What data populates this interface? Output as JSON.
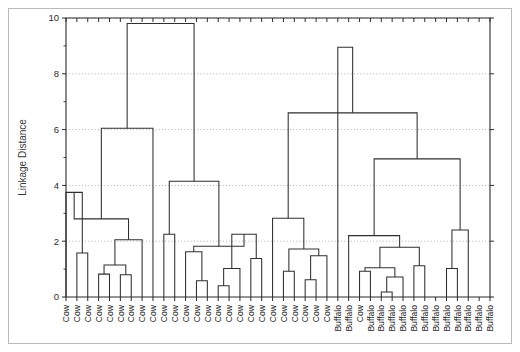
{
  "chart_data": {
    "type": "line",
    "subtype": "dendrogram",
    "title": "",
    "xlabel": "",
    "ylabel": "Linkage Distance",
    "ylim": [
      0,
      10
    ],
    "yticks": [
      0,
      2,
      4,
      6,
      8,
      10
    ],
    "ytick_labels": [
      "0",
      "2",
      "4",
      "6",
      "8",
      "10"
    ],
    "yticks_minor": [
      1,
      3,
      5,
      7,
      9
    ],
    "grid": "horizontal-dotted",
    "legend": "none",
    "orientation": "vertical",
    "leaf_labels": [
      "Cow",
      "Cow",
      "Cow",
      "Cow",
      "Cow",
      "Cow",
      "Cow",
      "Cow",
      "Cow",
      "Cow",
      "Cow",
      "Cow",
      "Cow",
      "Cow",
      "Cow",
      "Cow",
      "Cow",
      "Cow",
      "Cow",
      "Cow",
      "Cow",
      "Cow",
      "Cow",
      "Cow",
      "Cow",
      "Buffalo",
      "Buffalo",
      "Cow",
      "Buffalo",
      "Buffalo",
      "Buffalo",
      "Buffalo",
      "Buffalo",
      "Buffalo",
      "Buffalo",
      "Buffalo",
      "Buffalo",
      "Buffalo",
      "Buffalo",
      "Buffalo"
    ],
    "n_leaves": 40,
    "merges": [
      {
        "id": "m1",
        "left": {
          "leaf": 1
        },
        "right": {
          "leaf": 2
        },
        "height": 1.58
      },
      {
        "id": "m2",
        "left": {
          "node": "m1"
        },
        "right": {
          "leaf": 0
        },
        "height": 3.75
      },
      {
        "id": "m3",
        "left": {
          "leaf": 3
        },
        "right": {
          "leaf": 4
        },
        "height": 0.82
      },
      {
        "id": "m4",
        "left": {
          "leaf": 5
        },
        "right": {
          "leaf": 6
        },
        "height": 0.8
      },
      {
        "id": "m5",
        "left": {
          "node": "m3"
        },
        "right": {
          "node": "m4"
        },
        "height": 1.15
      },
      {
        "id": "m6",
        "left": {
          "node": "m5"
        },
        "right": {
          "leaf": 7
        },
        "height": 2.05
      },
      {
        "id": "m7",
        "left": {
          "node": "m6"
        },
        "right": {
          "node": "m2"
        },
        "height": 2.8
      },
      {
        "id": "m8",
        "left": {
          "node": "m7"
        },
        "right": {
          "leaf": 8
        },
        "height": 6.05
      },
      {
        "id": "m9",
        "left": {
          "leaf": 9
        },
        "right": {
          "leaf": 10
        },
        "height": 2.25
      },
      {
        "id": "m10",
        "left": {
          "leaf": 12
        },
        "right": {
          "leaf": 13
        },
        "height": 0.58
      },
      {
        "id": "m11",
        "left": {
          "node": "m10"
        },
        "right": {
          "leaf": 11
        },
        "height": 1.62
      },
      {
        "id": "m12",
        "left": {
          "leaf": 14
        },
        "right": {
          "leaf": 15
        },
        "height": 0.4
      },
      {
        "id": "m13",
        "left": {
          "node": "m12"
        },
        "right": {
          "leaf": 16
        },
        "height": 1.02
      },
      {
        "id": "m14",
        "left": {
          "leaf": 17
        },
        "right": {
          "leaf": 18
        },
        "height": 1.38
      },
      {
        "id": "m15",
        "left": {
          "node": "m13"
        },
        "right": {
          "node": "m14"
        },
        "height": 2.25
      },
      {
        "id": "m16",
        "left": {
          "node": "m11"
        },
        "right": {
          "node": "m15"
        },
        "height": 1.82
      },
      {
        "id": "m17",
        "left": {
          "node": "m16"
        },
        "right": {
          "node": "m9"
        },
        "height": 4.15
      },
      {
        "id": "m18",
        "left": {
          "node": "m17"
        },
        "right": {
          "node": "m8"
        },
        "height": 9.8
      },
      {
        "id": "m19",
        "left": {
          "leaf": 20
        },
        "right": {
          "leaf": 21
        },
        "height": 0.92
      },
      {
        "id": "m20",
        "left": {
          "leaf": 22
        },
        "right": {
          "leaf": 23
        },
        "height": 0.62
      },
      {
        "id": "m21",
        "left": {
          "node": "m20"
        },
        "right": {
          "leaf": 24
        },
        "height": 1.48
      },
      {
        "id": "m22",
        "left": {
          "node": "m19"
        },
        "right": {
          "node": "m21"
        },
        "height": 1.72
      },
      {
        "id": "m23",
        "left": {
          "node": "m22"
        },
        "right": {
          "leaf": 19
        },
        "height": 2.82
      },
      {
        "id": "m24",
        "left": {
          "leaf": 27
        },
        "right": {
          "leaf": 28
        },
        "height": 0.92
      },
      {
        "id": "m25",
        "left": {
          "leaf": 29
        },
        "right": {
          "leaf": 30
        },
        "height": 0.18
      },
      {
        "id": "m26",
        "left": {
          "node": "m25"
        },
        "right": {
          "leaf": 31
        },
        "height": 0.72
      },
      {
        "id": "m27",
        "left": {
          "node": "m24"
        },
        "right": {
          "node": "m26"
        },
        "height": 1.05
      },
      {
        "id": "m28",
        "left": {
          "leaf": 32
        },
        "right": {
          "leaf": 33
        },
        "height": 1.12
      },
      {
        "id": "m29",
        "left": {
          "node": "m27"
        },
        "right": {
          "node": "m28"
        },
        "height": 1.78
      },
      {
        "id": "m30",
        "left": {
          "node": "m29"
        },
        "right": {
          "leaf": 26
        },
        "height": 2.2
      },
      {
        "id": "m31",
        "left": {
          "leaf": 35
        },
        "right": {
          "leaf": 36
        },
        "height": 1.02
      },
      {
        "id": "m32",
        "left": {
          "node": "m31"
        },
        "right": {
          "leaf": 37
        },
        "height": 2.4
      },
      {
        "id": "m33",
        "left": {
          "node": "m30"
        },
        "right": {
          "node": "m32"
        },
        "height": 4.95
      },
      {
        "id": "m34",
        "left": {
          "node": "m23"
        },
        "right": {
          "node": "m33"
        },
        "height": 6.6
      },
      {
        "id": "m35",
        "left": {
          "node": "m34"
        },
        "right": {
          "leaf": 25
        },
        "height": 8.95
      }
    ],
    "colors": {
      "line": "#2f2f2f",
      "axis": "#2b2b2b",
      "grid": "#9a9a9a",
      "background": "#ffffff",
      "frame": "#b9b9b9"
    }
  }
}
